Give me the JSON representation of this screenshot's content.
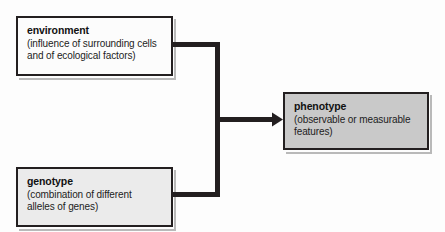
{
  "diagram": {
    "type": "flow-diagram",
    "background_color": "#fdfdfd",
    "connector_color": "#231f20",
    "nodes": [
      {
        "id": "environment",
        "title": "environment",
        "description": "(influence of surrounding cells and of ecological factors)",
        "description_line1": "(influence of surrounding cells",
        "description_line2": "and of ecological factors)",
        "fill_color": "#fcfcfc",
        "border_color": "#231f20",
        "role": "input"
      },
      {
        "id": "genotype",
        "title": "genotype",
        "description": "(combination of different alleles of genes)",
        "description_line1": "(combination of different",
        "description_line2": "alleles of genes)",
        "fill_color": "#ebebeb",
        "border_color": "#231f20",
        "role": "input"
      },
      {
        "id": "phenotype",
        "title": "phenotype",
        "description": "(observable or measurable features)",
        "description_line1": "(observable or measurable",
        "description_line2": "features)",
        "fill_color": "#c9c9c9",
        "border_color": "#231f20",
        "role": "output"
      }
    ],
    "connector": {
      "name": "merge-arrow",
      "from": [
        "environment",
        "genotype"
      ],
      "to": "phenotype",
      "style": "bracket-with-arrowhead",
      "color": "#231f20"
    }
  }
}
